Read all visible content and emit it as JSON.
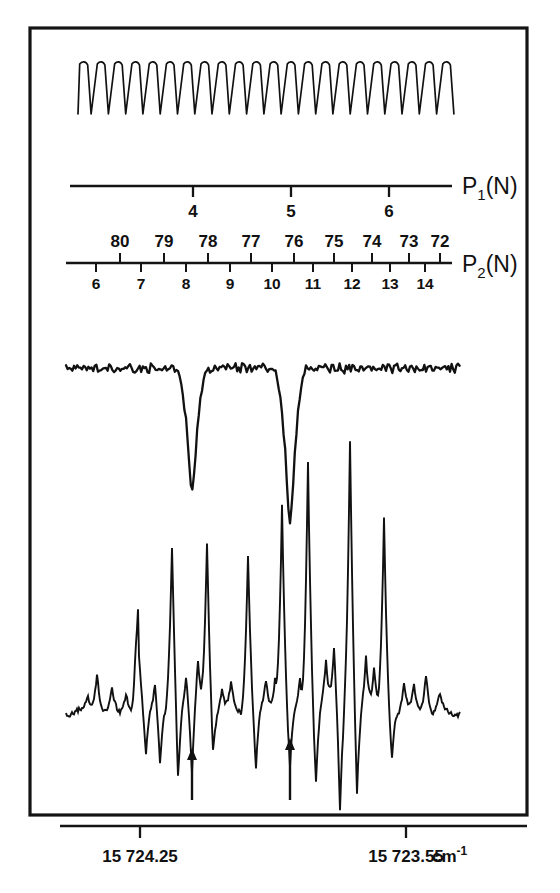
{
  "figure": {
    "frame": {
      "x": 30,
      "y": 28,
      "width": 497,
      "height": 787
    }
  },
  "etalon": {
    "name": "etalon-fringe-trace",
    "fringe_count": 22,
    "x_start": 78,
    "x_end": 458,
    "baseline_y": 62,
    "depth_px": 52,
    "description": "Periodic Fabry-Perot etalon transmission comb, 22 downward fringes"
  },
  "axis_p1": {
    "label": "P",
    "label_sub": "1",
    "label_tail": "(N)",
    "line_x_start": 70,
    "line_x_end": 452,
    "line_y": 186,
    "ticks": [
      {
        "value": "4",
        "x": 193
      },
      {
        "value": "5",
        "x": 291
      },
      {
        "value": "6",
        "x": 389
      }
    ]
  },
  "axis_p2": {
    "label": "P",
    "label_sub": "2",
    "label_tail": "(N)",
    "line_x_start": 66,
    "line_x_end": 452,
    "line_y": 263,
    "ticks_upper": [
      {
        "value": "80",
        "x": 120
      },
      {
        "value": "79",
        "x": 164
      },
      {
        "value": "78",
        "x": 208
      },
      {
        "value": "77",
        "x": 251
      },
      {
        "value": "76",
        "x": 294
      },
      {
        "value": "75",
        "x": 334
      },
      {
        "value": "74",
        "x": 372
      },
      {
        "value": "73",
        "x": 409
      },
      {
        "value": "72",
        "x": 440
      }
    ],
    "ticks_lower": [
      {
        "value": "6",
        "x": 96
      },
      {
        "value": "7",
        "x": 141
      },
      {
        "value": "8",
        "x": 186
      },
      {
        "value": "9",
        "x": 230
      },
      {
        "value": "10",
        "x": 272
      },
      {
        "value": "11",
        "x": 313
      },
      {
        "value": "12",
        "x": 352
      },
      {
        "value": "13",
        "x": 390
      },
      {
        "value": "14",
        "x": 425
      }
    ]
  },
  "absorption_trace": {
    "name": "reference-absorption-trace",
    "baseline_y": 368,
    "x_start": 66,
    "x_end": 460,
    "dips": [
      {
        "x": 192,
        "depth": 92,
        "halfwidth": 9
      },
      {
        "x": 290,
        "depth": 118,
        "halfwidth": 9
      }
    ],
    "noise_amplitude": 7,
    "description": "Noisy baseline with two deep absorption dips marking reference lines"
  },
  "main_trace": {
    "name": "excitation-spectrum-trace",
    "baseline_y": 712,
    "x_start": 66,
    "x_end": 460,
    "peaks": [
      {
        "x": 88,
        "height": 14,
        "width": 5
      },
      {
        "x": 97,
        "height": 42,
        "width": 5
      },
      {
        "x": 112,
        "height": 20,
        "width": 5
      },
      {
        "x": 126,
        "height": 22,
        "width": 5
      },
      {
        "x": 136,
        "height": 16,
        "width": 4
      },
      {
        "x": 139,
        "height": -38,
        "width": 4
      },
      {
        "x": 138,
        "height": 120,
        "width": 5
      },
      {
        "x": 146,
        "height": -44,
        "width": 4
      },
      {
        "x": 155,
        "height": 30,
        "width": 5
      },
      {
        "x": 160,
        "height": -52,
        "width": 4
      },
      {
        "x": 172,
        "height": 160,
        "width": 5
      },
      {
        "x": 178,
        "height": -70,
        "width": 4
      },
      {
        "x": 186,
        "height": 38,
        "width": 5
      },
      {
        "x": 192,
        "height": -62,
        "width": 4
      },
      {
        "x": 198,
        "height": 48,
        "width": 5
      },
      {
        "x": 207,
        "height": 168,
        "width": 5
      },
      {
        "x": 213,
        "height": -40,
        "width": 4
      },
      {
        "x": 222,
        "height": 26,
        "width": 5
      },
      {
        "x": 231,
        "height": 28,
        "width": 5
      },
      {
        "x": 248,
        "height": 160,
        "width": 5
      },
      {
        "x": 256,
        "height": -56,
        "width": 4
      },
      {
        "x": 266,
        "height": 30,
        "width": 5
      },
      {
        "x": 275,
        "height": 36,
        "width": 5
      },
      {
        "x": 282,
        "height": 208,
        "width": 5
      },
      {
        "x": 290,
        "height": -58,
        "width": 4
      },
      {
        "x": 300,
        "height": 34,
        "width": 5
      },
      {
        "x": 308,
        "height": 255,
        "width": 5
      },
      {
        "x": 316,
        "height": -70,
        "width": 4
      },
      {
        "x": 326,
        "height": 52,
        "width": 5
      },
      {
        "x": 334,
        "height": 66,
        "width": 5
      },
      {
        "x": 340,
        "height": -98,
        "width": 4
      },
      {
        "x": 350,
        "height": 268,
        "width": 5
      },
      {
        "x": 357,
        "height": -82,
        "width": 4
      },
      {
        "x": 366,
        "height": 58,
        "width": 5
      },
      {
        "x": 374,
        "height": 44,
        "width": 5
      },
      {
        "x": 384,
        "height": 190,
        "width": 5
      },
      {
        "x": 392,
        "height": -42,
        "width": 4
      },
      {
        "x": 404,
        "height": 28,
        "width": 5
      },
      {
        "x": 414,
        "height": 24,
        "width": 5
      },
      {
        "x": 426,
        "height": 40,
        "width": 5
      },
      {
        "x": 440,
        "height": 16,
        "width": 5
      }
    ],
    "description": "Sub-Doppler excitation spectrum with strong upward lines and inverted crossover dips"
  },
  "markers": {
    "name": "assignment-arrows",
    "arrows": [
      {
        "x": 192,
        "y_tip": 748,
        "y_tail": 800
      },
      {
        "x": 290,
        "y_tip": 738,
        "y_tail": 800
      }
    ],
    "description": "Two vertical arrows marking the reference absorption line positions"
  },
  "wavenumber_axis": {
    "line_y": 826,
    "line_x_start": 60,
    "line_x_end": 527,
    "ticks": [
      {
        "x": 140,
        "label": "15 724.25"
      },
      {
        "x": 406,
        "label": "15 723.55"
      }
    ],
    "unit": "cm",
    "unit_sup": "-1"
  }
}
